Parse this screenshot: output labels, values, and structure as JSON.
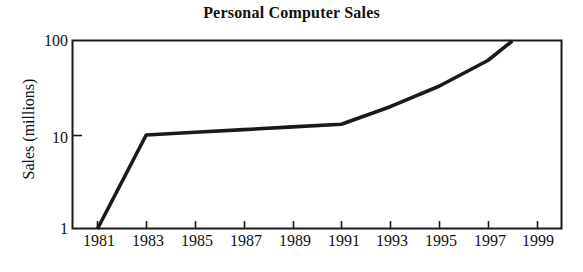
{
  "chart_data": {
    "type": "line",
    "title": "Personal Computer Sales",
    "xlabel": "",
    "ylabel": "Sales (millions)",
    "yscale": "log",
    "ylim": [
      1,
      100
    ],
    "xlim": [
      1980,
      2000
    ],
    "grid": false,
    "legend": null,
    "y_ticks": [
      {
        "value": 1,
        "label": "1"
      },
      {
        "value": 10,
        "label": "10"
      },
      {
        "value": 100,
        "label": "100"
      }
    ],
    "x_ticks": [
      {
        "value": 1981,
        "label": "1981"
      },
      {
        "value": 1983,
        "label": "1983"
      },
      {
        "value": 1985,
        "label": "1985"
      },
      {
        "value": 1987,
        "label": "1987"
      },
      {
        "value": 1989,
        "label": "1989"
      },
      {
        "value": 1991,
        "label": "1991"
      },
      {
        "value": 1993,
        "label": "1993"
      },
      {
        "value": 1995,
        "label": "1995"
      },
      {
        "value": 1997,
        "label": "1997"
      },
      {
        "value": 1999,
        "label": "1999"
      }
    ],
    "series": [
      {
        "name": "Personal Computer Sales",
        "color": "#1a1a1a",
        "x": [
          1981,
          1983,
          1985,
          1987,
          1989,
          1991,
          1993,
          1995,
          1997,
          1998
        ],
        "values": [
          1,
          10,
          10.7,
          11.4,
          12.2,
          13,
          20,
          33,
          62,
          100
        ]
      }
    ]
  },
  "style": {
    "axis_color": "#1a1a1a",
    "line_color": "#1a1a1a",
    "background": "#ffffff"
  }
}
